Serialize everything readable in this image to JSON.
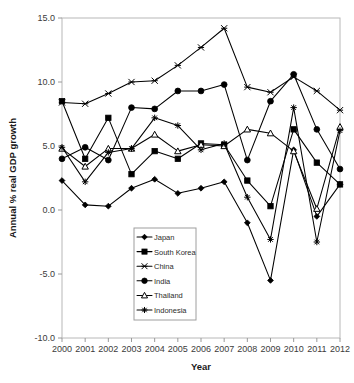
{
  "chart_data": {
    "type": "line",
    "title": "",
    "xlabel": "Year",
    "ylabel": "Annual % real GDP growth",
    "x": [
      2000,
      2001,
      2002,
      2003,
      2004,
      2005,
      2006,
      2007,
      2008,
      2009,
      2010,
      2011,
      2012
    ],
    "xtick_labels": [
      "2000",
      "2001",
      "2002",
      "2003",
      "2004",
      "2005",
      "2006",
      "2007",
      "2008",
      "2009",
      "2010",
      "2011",
      "2012"
    ],
    "ytick_labels": [
      "15.0",
      "10.0",
      "5.0",
      "0.0",
      "-5.0",
      "-10.0"
    ],
    "ytick_values": [
      15.0,
      10.0,
      5.0,
      0.0,
      -5.0,
      -10.0
    ],
    "ylim": [
      -10.0,
      15.0
    ],
    "xlim": [
      2000,
      2012
    ],
    "grid": false,
    "legend_position": "lower-center",
    "series": [
      {
        "name": "Japan",
        "marker": "diamond-filled",
        "values": [
          2.3,
          0.4,
          0.3,
          1.7,
          2.4,
          1.3,
          1.7,
          2.2,
          -1.0,
          -5.5,
          4.7,
          -0.5,
          2.0
        ]
      },
      {
        "name": "South Korea",
        "marker": "square-filled",
        "values": [
          8.5,
          4.0,
          7.2,
          2.8,
          4.6,
          4.0,
          5.2,
          5.1,
          2.3,
          0.3,
          6.3,
          3.7,
          2.0
        ]
      },
      {
        "name": "China",
        "marker": "x-cross",
        "values": [
          8.4,
          8.3,
          9.1,
          10.0,
          10.1,
          11.3,
          12.7,
          14.2,
          9.6,
          9.2,
          10.4,
          9.3,
          7.8
        ]
      },
      {
        "name": "India",
        "marker": "circle-filled",
        "values": [
          4.0,
          4.9,
          3.9,
          8.0,
          7.9,
          9.3,
          9.3,
          9.8,
          3.9,
          8.5,
          10.6,
          6.3,
          3.2
        ]
      },
      {
        "name": "Thailand",
        "marker": "triangle-open",
        "values": [
          4.8,
          3.4,
          4.8,
          4.8,
          5.9,
          4.6,
          5.1,
          5.0,
          6.3,
          6.0,
          4.6,
          0.1,
          6.5
        ]
      },
      {
        "name": "Indonesia",
        "marker": "star-plus",
        "values": [
          4.9,
          2.2,
          4.5,
          4.8,
          7.2,
          6.6,
          4.7,
          5.2,
          1.0,
          -2.3,
          8.0,
          -2.5,
          6.2
        ]
      }
    ]
  }
}
